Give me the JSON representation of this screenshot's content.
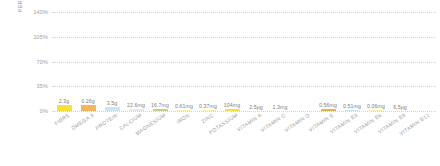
{
  "chart_data": {
    "type": "bar",
    "title": "",
    "subtitle": "",
    "xlabel": "",
    "ylabel": "PERCENTAGE OF RDA",
    "ylim": [
      0,
      140
    ],
    "yticks": [
      "0%",
      "35%",
      "70%",
      "105%",
      "140%"
    ],
    "ytick_values": [
      0,
      35,
      70,
      105,
      140
    ],
    "grid": true,
    "legend": false,
    "categories": [
      "FIBRE",
      "OMEGA 3",
      "PROTEIN",
      "CALCIUM",
      "MAGNESIUM",
      "IRON",
      "ZINC",
      "POTASSIUM",
      "VITAMIN A",
      "VITAMIN C",
      "VITAMIN D",
      "VITAMIN E",
      "VITAMIN B3",
      "VITAMIN B6",
      "VITAMIN B9",
      "VITAMIN B12"
    ],
    "values": [
      9,
      8,
      5,
      3,
      3,
      2,
      2,
      3,
      0,
      0,
      0,
      3,
      2,
      2,
      0,
      0
    ],
    "data_labels": [
      "2.3g",
      "0.26g",
      "3.5g",
      "22.6mg",
      "16.7mg",
      "0.61mg",
      "0.37mg",
      "104mg",
      "2.5µg",
      "1.3mg",
      "",
      "0.56mg",
      "0.51mg",
      "0.06mg",
      "6.5µg",
      ""
    ],
    "bar_colors": [
      "#f7e03d",
      "#f5b55c",
      "#c9e7f2",
      "#e8e8e8",
      "#c9c98a",
      "#fbf0b0",
      "#fbf0b0",
      "#f7e03d",
      "#ffffff",
      "#ffffff",
      "#ffffff",
      "#e8b14a",
      "#c9e7f2",
      "#fbf0b0",
      "#ffffff",
      "#ffffff"
    ],
    "colors": {
      "grid": "#d2d2d2",
      "axis_text": "#9a9a9a",
      "label_text": "#7d7d7d",
      "background": "#ffffff"
    }
  }
}
